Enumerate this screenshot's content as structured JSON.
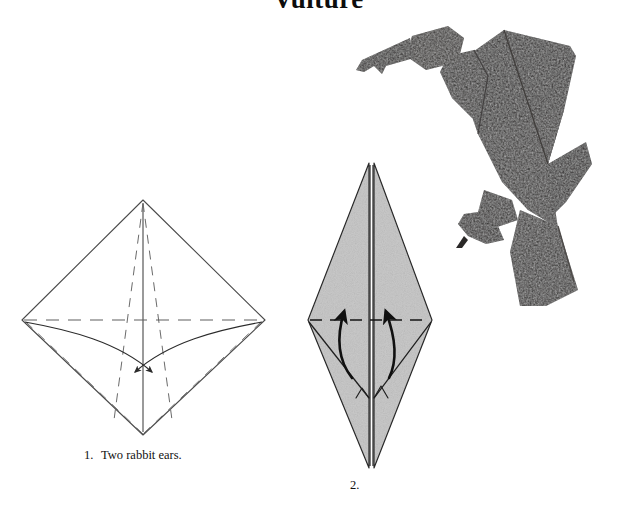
{
  "page": {
    "title": "Vulture",
    "background_color": "#ffffff",
    "width": 637,
    "height": 511
  },
  "colors": {
    "ink": "#111111",
    "line": "#3a3a3a",
    "crease_dashed": "#6a6a6a",
    "paper_gray": "#c9c9c9",
    "paper_gray_shadow": "#b4b4b4",
    "photo_dark": "#2e2c2b",
    "photo_dark_2": "#3a3836",
    "white": "#ffffff"
  },
  "steps": [
    {
      "id": "step-1",
      "number": "1.",
      "caption": "Two rabbit ears.",
      "shape": "wide-diamond",
      "fill": "white",
      "arrows": 2,
      "arrow_direction": "inward-down"
    },
    {
      "id": "step-2",
      "number": "2.",
      "caption": "",
      "shape": "tall-diamond",
      "fill": "gray",
      "arrows": 2,
      "arrow_direction": "upward"
    }
  ],
  "photo": {
    "subject": "origami-vulture",
    "description": "folded paper vulture, dark textured paper, hooked beak facing left, long tail to lower right"
  }
}
